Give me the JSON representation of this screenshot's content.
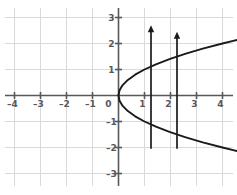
{
  "figure": {
    "title": ""
  },
  "chart_data": {
    "type": "line",
    "title": "",
    "xlabel": "",
    "ylabel": "",
    "xlim": [
      -4.55,
      4.6
    ],
    "ylim": [
      -3.4,
      3.5
    ],
    "grid": true,
    "legend": false,
    "xticks": [
      -4,
      -3,
      -2,
      -1,
      0,
      1,
      2,
      3,
      4
    ],
    "xticklabels": [
      "–4",
      "–3",
      "–2",
      "–1",
      "0",
      "1",
      "2",
      "3",
      "4"
    ],
    "yticks": [
      -3,
      -2,
      -1,
      0,
      1,
      2,
      3
    ],
    "yticklabels": [
      "–3",
      "–2",
      "–1",
      "0",
      "1",
      "2",
      "3"
    ],
    "series": [
      {
        "name": "parabola-upper-branch",
        "relation": "x = y^2",
        "x": [
          0,
          0.04,
          0.16,
          0.36,
          0.64,
          1.0,
          1.44,
          1.96,
          2.56,
          3.24,
          4.0,
          4.41
        ],
        "y": [
          0,
          0.2,
          0.4,
          0.6,
          0.8,
          1.0,
          1.2,
          1.4,
          1.6,
          1.8,
          2.0,
          2.1
        ]
      },
      {
        "name": "parabola-lower-branch",
        "relation": "x = y^2",
        "x": [
          0,
          0.04,
          0.16,
          0.36,
          0.64,
          1.0,
          1.44,
          1.96,
          2.56,
          3.24,
          4.0,
          4.41
        ],
        "y": [
          0,
          -0.2,
          -0.4,
          -0.6,
          -0.8,
          -1.0,
          -1.2,
          -1.4,
          -1.6,
          -1.8,
          -2.0,
          -2.1
        ]
      }
    ],
    "annotations": [
      {
        "name": "vertical-arrow-1",
        "type": "arrow",
        "x": 1.25,
        "y_start": -2.05,
        "y_end": 2.7,
        "direction": "up"
      },
      {
        "name": "vertical-arrow-2",
        "type": "arrow",
        "x": 2.25,
        "y_start": -2.05,
        "y_end": 2.45,
        "direction": "up"
      }
    ]
  },
  "colors": {
    "background": "#ffffff",
    "grid": "#d9d9de",
    "axis": "#58585a",
    "curve": "#1a1a1a",
    "arrow": "#1a1a1a",
    "label": "#58585a"
  }
}
